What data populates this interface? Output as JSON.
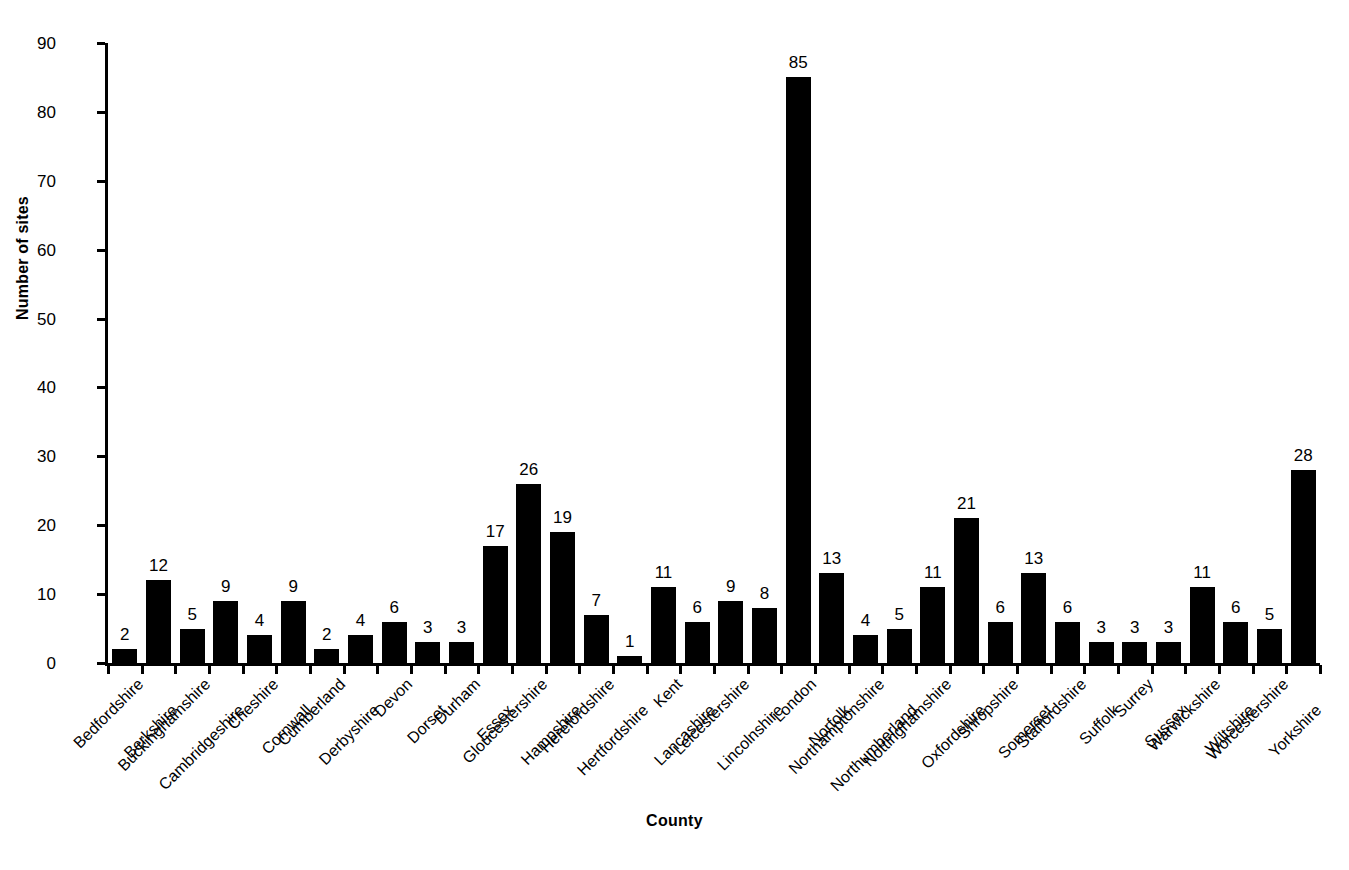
{
  "chart_data": {
    "type": "bar",
    "title": "",
    "xlabel": "County",
    "ylabel": "Number of sites",
    "ylim": [
      0,
      90
    ],
    "yticks": [
      0,
      10,
      20,
      30,
      40,
      50,
      60,
      70,
      80,
      90
    ],
    "grid": false,
    "legend": null,
    "bar_color": "#000000",
    "data_labels": true,
    "categories": [
      "Bedfordshire",
      "Berkshire",
      "Buckinghamshire",
      "Cambridgeshire",
      "Cheshire",
      "Cornwall",
      "Cumberland",
      "Derbyshire",
      "Devon",
      "Dorset",
      "Durham",
      "Essex",
      "Gloucestershire",
      "Hampshire",
      "Herefordshire",
      "Hertfordshire",
      "Kent",
      "Lancashire",
      "Leicestershire",
      "Lincolnshire",
      "London",
      "Norfolk",
      "Northamptonshire",
      "Northumberland",
      "Nottinghamshire",
      "Oxfordshire",
      "Shropshire",
      "Somerset",
      "Staffordshire",
      "Suffolk",
      "Surrey",
      "Sussex",
      "Warwickshire",
      "Wiltshire",
      "Worcestershire",
      "Yorkshire"
    ],
    "values": [
      2,
      12,
      5,
      9,
      4,
      9,
      2,
      4,
      6,
      3,
      3,
      17,
      26,
      19,
      7,
      1,
      11,
      6,
      9,
      8,
      85,
      13,
      4,
      5,
      11,
      21,
      6,
      13,
      6,
      3,
      3,
      3,
      11,
      6,
      5,
      28
    ]
  }
}
